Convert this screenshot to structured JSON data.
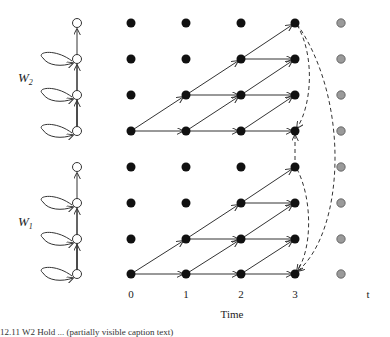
{
  "diagram": {
    "title": "",
    "x_axis": {
      "label": "Time",
      "ticks": [
        "0",
        "1",
        "2",
        "3",
        "t"
      ]
    },
    "group_labels": [
      {
        "name": "W",
        "subscript": "2"
      },
      {
        "name": "W",
        "subscript": "1"
      }
    ],
    "left_chain": {
      "node_color": "#ffffff",
      "groups": 2,
      "nodes_per_group": 4,
      "self_loops_per_group": 3
    },
    "grid": {
      "columns": [
        "0",
        "1",
        "2",
        "3"
      ],
      "rows": 8,
      "node_color": "#111111",
      "edge_color": "#333333"
    },
    "time_t_column": {
      "node_color": "#999999",
      "rows": 8
    },
    "dashed_edges_color": "#333333",
    "caption_fragment": "12.11 W2 Hold ... (partially visible caption text)"
  }
}
